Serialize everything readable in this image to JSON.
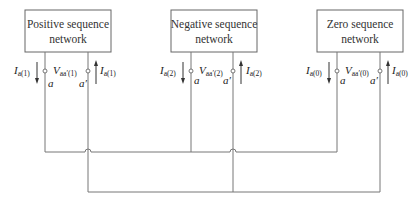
{
  "networks": [
    {
      "id": "positive",
      "label_line1": "Positive sequence",
      "label_line2": "network",
      "current_main": "I",
      "current_sub": "a(1)",
      "voltage_main": "V",
      "voltage_sub": "aa′(1)",
      "terminal_a": "a",
      "terminal_a_prime": "a′",
      "current_out_main": "I",
      "current_out_sub": "a(1)"
    },
    {
      "id": "negative",
      "label_line1": "Negative sequence",
      "label_line2": "network",
      "current_main": "I",
      "current_sub": "a(2)",
      "voltage_main": "V",
      "voltage_sub": "aa′(2)",
      "terminal_a": "a",
      "terminal_a_prime": "a′",
      "current_out_main": "I",
      "current_out_sub": "a(2)"
    },
    {
      "id": "zero",
      "label_line1": "Zero sequence",
      "label_line2": "network",
      "current_main": "I",
      "current_sub": "a(0)",
      "voltage_main": "V",
      "voltage_sub": "aa′(0)",
      "terminal_a": "a",
      "terminal_a_prime": "a′",
      "current_out_main": "I",
      "current_out_sub": "a(0)"
    }
  ],
  "colors": {
    "wire": "#777777",
    "box_border": "#666666",
    "text": "#222222"
  }
}
